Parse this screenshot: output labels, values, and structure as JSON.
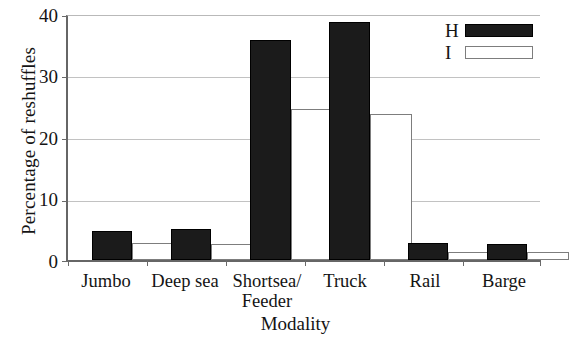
{
  "chart_data": {
    "type": "bar",
    "title": "",
    "xlabel": "Modality",
    "ylabel": "Percentage of reshuffles",
    "categories": [
      "Jumbo",
      "Deep sea",
      "Shortsea/\nFeeder",
      "Truck",
      "Rail",
      "Barge"
    ],
    "category_lines": [
      [
        "Jumbo"
      ],
      [
        "Deep sea"
      ],
      [
        "Shortsea/",
        "Feeder"
      ],
      [
        "Truck"
      ],
      [
        "Rail"
      ],
      [
        "Barge"
      ]
    ],
    "series": [
      {
        "name": "H",
        "style": "filled",
        "color": "#1b1b1b",
        "values": [
          4.7,
          5.0,
          36.0,
          39.0,
          2.8,
          2.7
        ]
      },
      {
        "name": "I",
        "style": "open",
        "color": "#ffffff",
        "values": [
          2.8,
          2.7,
          24.7,
          23.9,
          1.3,
          1.3
        ]
      }
    ],
    "ylim": [
      0,
      40
    ],
    "yticks": [
      0,
      10,
      20,
      30,
      40
    ],
    "ytick_labels": [
      "0",
      "10",
      "20",
      "30",
      "40"
    ],
    "grid": "horizontal",
    "legend_position": "top-right",
    "legend_entries": [
      {
        "label": "H",
        "swatch": "filled"
      },
      {
        "label": "I",
        "swatch": "open"
      }
    ]
  }
}
